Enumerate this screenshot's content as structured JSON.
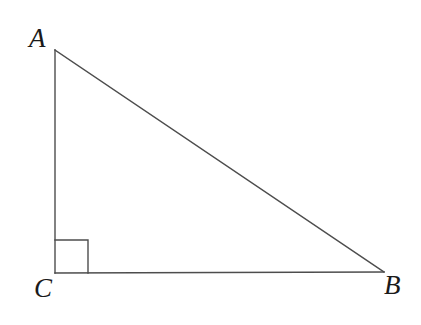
{
  "figure": {
    "name": "right-triangle-ABC",
    "type": "geometry-diagram",
    "background_color": "#ffffff",
    "stroke_color": "#4d4d4d",
    "label_color": "#1a1a1a",
    "stroke_width": 1.4,
    "width": 421,
    "height": 325
  },
  "vertices": [
    {
      "id": "A",
      "label": "A",
      "x": 55,
      "y": 50
    },
    {
      "id": "B",
      "label": "B",
      "x": 384,
      "y": 272
    },
    {
      "id": "C",
      "label": "C",
      "x": 55,
      "y": 273
    }
  ],
  "labels": {
    "A": "A",
    "B": "B",
    "C": "C"
  },
  "segments": [
    {
      "id": "AC",
      "from": "A",
      "to": "C",
      "name": "leg-vertical-AC"
    },
    {
      "id": "CB",
      "from": "C",
      "to": "B",
      "name": "leg-horizontal-CB"
    },
    {
      "id": "AB",
      "from": "A",
      "to": "B",
      "name": "hypotenuse-AB"
    }
  ],
  "right_angle_marker": {
    "at_vertex": "C",
    "size": 33,
    "x": 55,
    "y": 240
  }
}
